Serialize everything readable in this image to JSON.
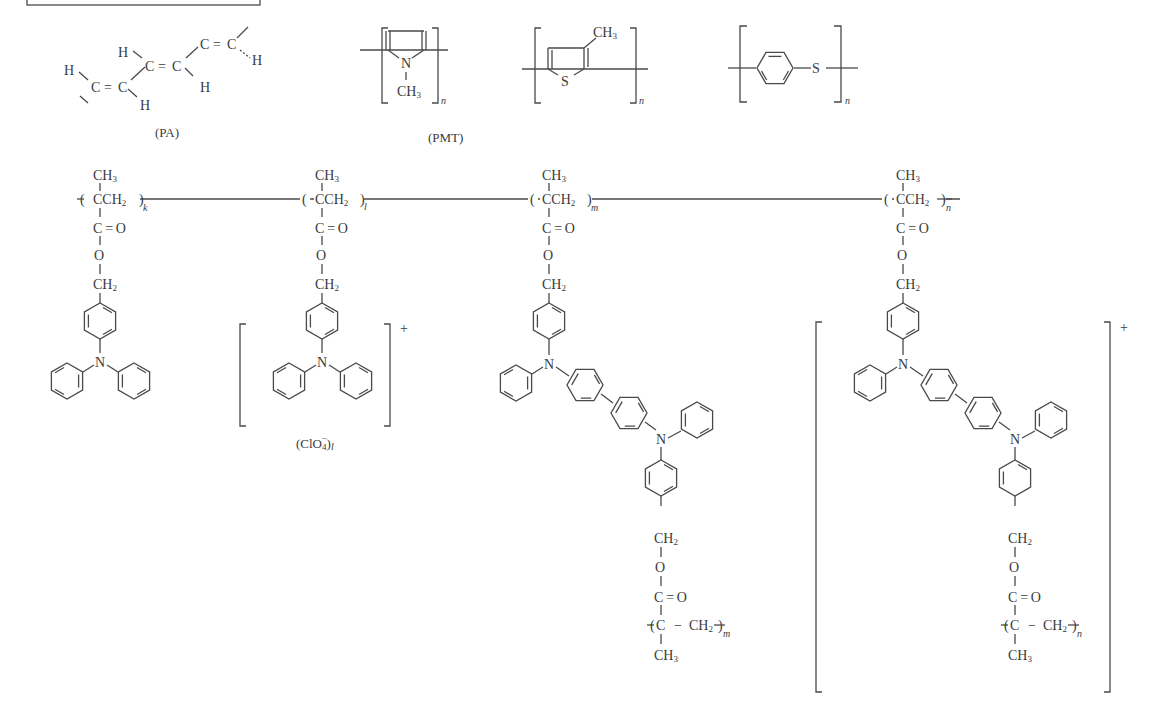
{
  "figure": {
    "top_row": {
      "structures": [
        {
          "id": "pa",
          "caption": "(PA)",
          "atoms": {
            "h": "H",
            "c": "C",
            "dbl": "="
          }
        },
        {
          "id": "pmpy",
          "atoms": {
            "n": "N",
            "ch3": "CH",
            "ch3_sub": "3"
          },
          "repeat": "n"
        },
        {
          "id": "pmt",
          "caption": "(PMT)",
          "atoms": {
            "s": "S",
            "ch3": "CH",
            "ch3_sub": "3"
          },
          "repeat": "n"
        },
        {
          "id": "pps",
          "atoms": {
            "s": "S"
          },
          "repeat": "n"
        }
      ]
    },
    "bottom_row": {
      "units": [
        {
          "id": "unit-k",
          "index": "k",
          "ch3": "CH",
          "ch3_sub": "3",
          "cch2": "CCH",
          "cch2_sub": "2",
          "co": "C = O",
          "o": "O",
          "ch2": "CH",
          "ch2_sub": "2",
          "n": "N"
        },
        {
          "id": "unit-l",
          "index": "l",
          "ch3": "CH",
          "ch3_sub": "3",
          "cch2": "CCH",
          "cch2_sub": "2",
          "co": "C = O",
          "o": "O",
          "ch2": "CH",
          "ch2_sub": "2",
          "n": "N",
          "charge": "+",
          "counterion": "(ClO",
          "counterion_sub": "4",
          "counterion_sup": "−",
          "counterion_close": ")",
          "counterion_index": "l"
        },
        {
          "id": "unit-m",
          "index": "m",
          "ch3": "CH",
          "ch3_sub": "3",
          "cch2": "CCH",
          "cch2_sub": "2",
          "co": "C = O",
          "o": "O",
          "ch2": "CH",
          "ch2_sub": "2",
          "n": "N",
          "tail": {
            "ch2": "CH",
            "ch2_sub": "2",
            "o": "O",
            "co": "C = O",
            "c": "C",
            "dash": "−",
            "ch2b": "CH",
            "ch2b_sub": "2",
            "ch3": "CH",
            "ch3_sub": "3",
            "index": "m"
          }
        },
        {
          "id": "unit-n",
          "index": "n",
          "ch3": "CH",
          "ch3_sub": "3",
          "cch2": "CCH",
          "cch2_sub": "2",
          "co": "C = O",
          "o": "O",
          "ch2": "CH",
          "ch2_sub": "2",
          "n": "N",
          "charge": "+",
          "tail": {
            "ch2": "CH",
            "ch2_sub": "2",
            "o": "O",
            "co": "C = O",
            "c": "C",
            "dash": "−",
            "ch2b": "CH",
            "ch2b_sub": "2",
            "ch3": "CH",
            "ch3_sub": "3",
            "index": "n"
          }
        }
      ]
    }
  }
}
